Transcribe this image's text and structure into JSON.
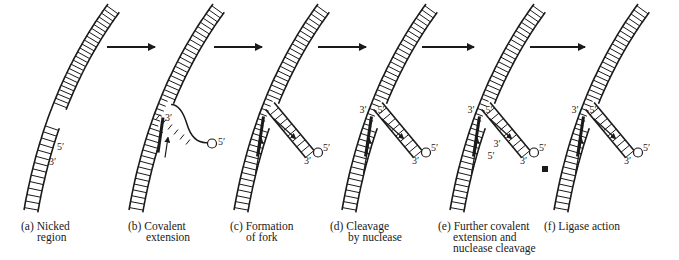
{
  "figure": {
    "panels": [
      {
        "id": "a",
        "caption_line1": "(a) Nicked",
        "caption_line2": "region",
        "caption_line3": "",
        "end_labels": [
          "5′",
          "3′"
        ]
      },
      {
        "id": "b",
        "caption_line1": "(b) Covalent",
        "caption_line2": "extension",
        "caption_line3": "",
        "end_labels": [
          "3′",
          "5′"
        ]
      },
      {
        "id": "c",
        "caption_line1": "(c) Formation",
        "caption_line2": "of fork",
        "caption_line3": "",
        "end_labels": [
          "5′",
          "3′"
        ]
      },
      {
        "id": "d",
        "caption_line1": "(d) Cleavage",
        "caption_line2": "by nuclease",
        "caption_line3": "",
        "end_labels": [
          "3′",
          "5′",
          "5′",
          "3′"
        ]
      },
      {
        "id": "e",
        "caption_line1": "(e) Further covalent",
        "caption_line2": "extension and",
        "caption_line3": "nuclease cleavage",
        "end_labels": [
          "3′",
          "5′",
          "3′",
          "5′",
          "5′",
          "3′"
        ]
      },
      {
        "id": "f",
        "caption_line1": "(f) Ligase action",
        "caption_line2": "",
        "caption_line3": "",
        "end_labels": [
          "3′",
          "5′",
          "5′",
          "3′"
        ]
      }
    ],
    "step_arrows": 5,
    "ink_color": "#1a1a1a"
  }
}
